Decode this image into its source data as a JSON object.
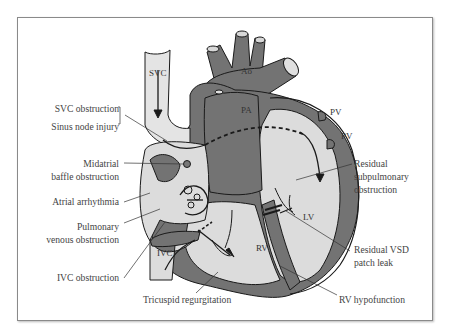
{
  "figure": {
    "anatomy_labels": {
      "svc": "SVC",
      "ivc": "IVC",
      "ao": "Ao",
      "pa": "PA",
      "pv1": "PV",
      "pv2": "PV",
      "lv": "LV",
      "rv": "RV"
    },
    "callouts_left": [
      {
        "id": "svc-obstruction",
        "text": "SVC obstruction"
      },
      {
        "id": "sinus-node-injury",
        "text": "Sinus node injury"
      },
      {
        "id": "midatrial-baffle-1",
        "text": "Midatrial"
      },
      {
        "id": "midatrial-baffle-2",
        "text": "baffle obstruction"
      },
      {
        "id": "atrial-arrhythmia",
        "text": "Atrial arrhythmia"
      },
      {
        "id": "pulmonary-venous-1",
        "text": "Pulmonary"
      },
      {
        "id": "pulmonary-venous-2",
        "text": "venous obstruction"
      },
      {
        "id": "ivc-obstruction",
        "text": "IVC obstruction"
      }
    ],
    "callouts_bottom": [
      {
        "id": "tricuspid-regurgitation",
        "text": "Tricuspid regurgitation"
      }
    ],
    "callouts_right": [
      {
        "id": "residual-subpulmonary-1",
        "text": "Residual"
      },
      {
        "id": "residual-subpulmonary-2",
        "text": "subpulmonary"
      },
      {
        "id": "residual-subpulmonary-3",
        "text": "obstruction"
      },
      {
        "id": "residual-vsd-1",
        "text": "Residual VSD"
      },
      {
        "id": "residual-vsd-2",
        "text": "patch leak"
      },
      {
        "id": "rv-hypofunction",
        "text": "RV hypofunction"
      }
    ],
    "colors": {
      "dark_tissue": "#6f6f6f",
      "light_chamber": "#dcdcdc",
      "outline": "#1a1a1a",
      "text": "#444444"
    }
  }
}
